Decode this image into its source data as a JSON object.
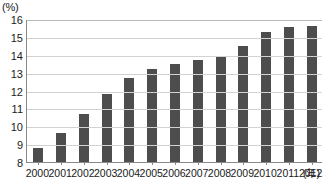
{
  "chart_data": {
    "type": "bar",
    "title": "",
    "subtitle": "",
    "xlabel": "(年)",
    "ylabel": "(%)",
    "categories": [
      "2000",
      "2001",
      "2002",
      "2003",
      "2004",
      "2005",
      "2006",
      "2007",
      "2008",
      "2009",
      "2010",
      "2011",
      "2012"
    ],
    "values": [
      8.8,
      9.65,
      10.7,
      11.8,
      12.7,
      13.2,
      13.5,
      13.7,
      13.9,
      14.5,
      15.25,
      15.55,
      15.6
    ],
    "series": [
      {
        "name": "",
        "values": [
          8.8,
          9.65,
          10.7,
          11.8,
          12.7,
          13.2,
          13.5,
          13.7,
          13.9,
          14.5,
          15.25,
          15.55,
          15.6
        ]
      }
    ],
    "ylim": [
      8,
      16
    ],
    "yticks": [
      8,
      9,
      10,
      11,
      12,
      13,
      14,
      15,
      16
    ],
    "ytick_labels": [
      "8",
      "9",
      "10",
      "11",
      "12",
      "13",
      "14",
      "15",
      "16"
    ],
    "grid": true,
    "grid_axis": "y",
    "legend": false,
    "legend_position": "none",
    "bar_color": "#4d4d4d",
    "gridline_color": "#d2d2d2",
    "axis_color": "#8a8a8a",
    "background_color": "#ffffff"
  },
  "axes": {
    "y_unit": "(%)",
    "x_unit": "(年)"
  }
}
